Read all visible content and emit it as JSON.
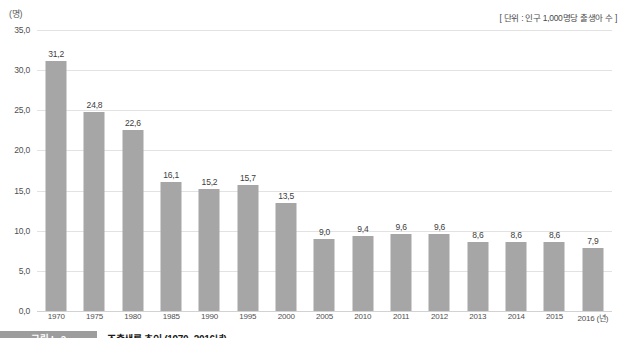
{
  "unit_y_label": "(명)",
  "unit_note": "[ 단위 : 인구 1,000명당 출생아 수 ]",
  "caption": {
    "tag": "그림 I - 2",
    "title": "조출생률 추이 (1970~2016년)"
  },
  "axis": {
    "x_suffix": "(년)",
    "y_ticks": [
      "0,0",
      "5,0",
      "10,0",
      "15,0",
      "20,0",
      "25,0",
      "30,0",
      "35,0"
    ]
  },
  "colors": {
    "bar": "#a6a6a6",
    "gridline": "#e2e2e2",
    "caption_tag_bg": "#9d9d9d"
  },
  "chart_data": {
    "type": "bar",
    "title": "조출생률 추이 (1970~2016년)",
    "xlabel": "(년)",
    "ylabel": "(명)",
    "ylim": [
      0,
      35
    ],
    "ytick_step": 5,
    "grid": true,
    "legend": "none",
    "value_label_format": "comma-decimal",
    "categories": [
      "1970",
      "1975",
      "1980",
      "1985",
      "1990",
      "1995",
      "2000",
      "2005",
      "2010",
      "2011",
      "2012",
      "2013",
      "2014",
      "2015",
      "2016"
    ],
    "tick_labels": [
      "1970",
      "1975",
      "1980",
      "1985",
      "1990",
      "1995",
      "2000",
      "2005",
      "2010",
      "2011",
      "2012",
      "2013",
      "2014",
      "2015",
      "2016 (년)"
    ],
    "values": [
      31.2,
      24.8,
      22.6,
      16.1,
      15.2,
      15.7,
      13.5,
      9.0,
      9.4,
      9.6,
      9.6,
      8.6,
      8.6,
      8.6,
      7.9
    ],
    "value_labels": [
      "31,2",
      "24,8",
      "22,6",
      "16,1",
      "15,2",
      "15,7",
      "13,5",
      "9,0",
      "9,4",
      "9,6",
      "9,6",
      "8,6",
      "8,6",
      "8,6",
      "7,9"
    ]
  }
}
